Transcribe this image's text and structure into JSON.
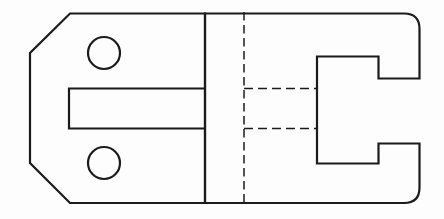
{
  "canvas": {
    "width": 444,
    "height": 219,
    "background": "#fdfdfd",
    "line_color": "#1b1b1b"
  },
  "drawing": {
    "kind": "engineering-orthographic-projection",
    "views": [
      {
        "name": "front-view",
        "description": "chamfered plate with two holes and open slot"
      },
      {
        "name": "side-view",
        "description": "rounded profile with C-shaped notch, centerline and hidden lines"
      }
    ],
    "shapes": [
      {
        "name": "front-view-outline",
        "view": "front-view",
        "kind": "polygon",
        "points": "70,13.5 205,13.5 205,203 70,203 30,163 30,53",
        "stroke_width": 2.2,
        "line_style": "solid"
      },
      {
        "name": "front-view-upper-hole",
        "view": "front-view",
        "kind": "circle",
        "cx": 104,
        "cy": 53,
        "r": 16,
        "stroke_width": 2.2,
        "line_style": "solid"
      },
      {
        "name": "front-view-lower-hole",
        "view": "front-view",
        "kind": "circle",
        "cx": 104,
        "cy": 163,
        "r": 16,
        "stroke_width": 2.2,
        "line_style": "solid"
      },
      {
        "name": "front-view-slot-outline",
        "view": "front-view",
        "kind": "polyline",
        "points": "205,88.5 69,88.5 69,128.5 205,128.5",
        "stroke_width": 2.2,
        "line_style": "solid"
      },
      {
        "name": "side-view-outline",
        "view": "side-view",
        "kind": "path",
        "d": "M 205 13.5 L 404 13.5 Q 419.5 13.5 419.5 29 L 419.5 78.5 L 378.5 78.5 L 378.5 56.5 L 317 56.5 L 317 163.5 L 378.5 163.5 L 378.5 143.5 L 419.5 143.5 L 419.5 187.5 Q 419.5 203 404 203 L 205 203 Z",
        "stroke_width": 2.2,
        "line_style": "solid"
      },
      {
        "name": "side-view-vertical-centerline",
        "view": "side-view",
        "kind": "line",
        "x1": 244,
        "y1": 12,
        "x2": 244,
        "y2": 204.5,
        "stroke_width": 1.5,
        "line_style": "dashed",
        "dash": "8.5 4.5"
      },
      {
        "name": "side-view-hidden-line-upper",
        "view": "side-view",
        "kind": "line",
        "x1": 244,
        "y1": 88.5,
        "x2": 317,
        "y2": 88.5,
        "stroke_width": 1.5,
        "line_style": "dashed",
        "dash": "9 5"
      },
      {
        "name": "side-view-hidden-line-lower",
        "view": "side-view",
        "kind": "line",
        "x1": 244,
        "y1": 128.5,
        "x2": 317,
        "y2": 128.5,
        "stroke_width": 1.5,
        "line_style": "dashed",
        "dash": "9 5"
      }
    ]
  }
}
